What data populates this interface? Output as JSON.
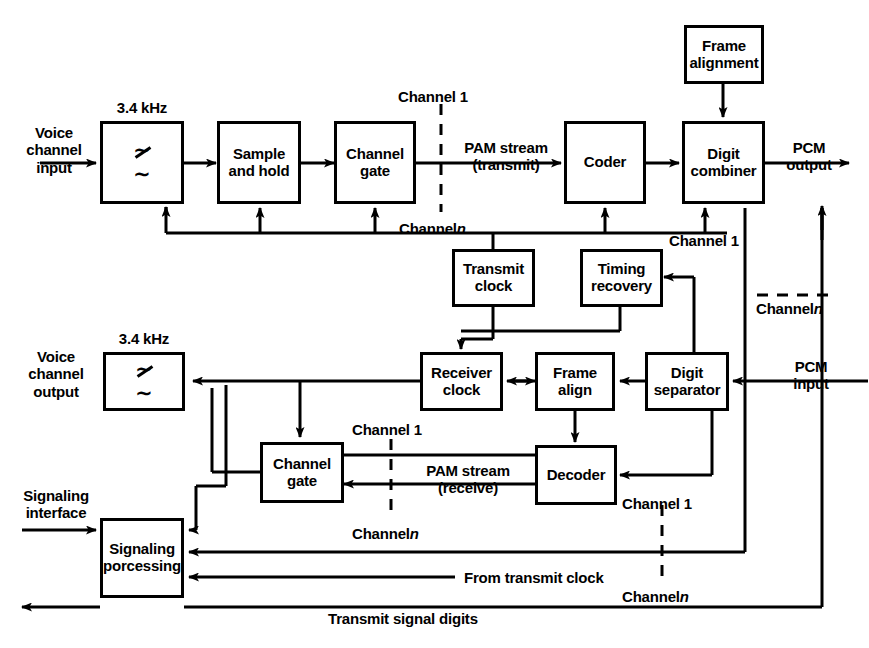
{
  "diagram": {
    "blocks": [
      {
        "id": "frame_alignment",
        "label": "Frame\nalignment"
      },
      {
        "id": "filter_tx",
        "label": "filter-symbol"
      },
      {
        "id": "sample_hold",
        "label": "Sample\nand\nhold"
      },
      {
        "id": "channel_gate_tx",
        "label": "Channel\ngate"
      },
      {
        "id": "coder",
        "label": "Coder"
      },
      {
        "id": "digit_combiner",
        "label": "Digit\ncombiner"
      },
      {
        "id": "transmit_clock",
        "label": "Transmit\nclock"
      },
      {
        "id": "timing_recovery",
        "label": "Timing\nrecovery"
      },
      {
        "id": "filter_rx",
        "label": "filter-symbol"
      },
      {
        "id": "receiver_clock",
        "label": "Receiver\nclock"
      },
      {
        "id": "frame_align",
        "label": "Frame\nalign"
      },
      {
        "id": "digit_separator",
        "label": "Digit\nseparator"
      },
      {
        "id": "channel_gate_rx",
        "label": "Channel\ngate"
      },
      {
        "id": "decoder",
        "label": "Decoder"
      },
      {
        "id": "signaling_processing",
        "label": "Signaling\nporcessing"
      }
    ],
    "labels": {
      "voice_channel_input": "Voice\nchannel\ninput",
      "filter_tx_caption": "3.4 kHz",
      "channel_1_tx_gate": "Channel  1",
      "channel_n_tx_gate": "Channel",
      "channel_n_tx_gate_italic": "n",
      "pam_stream_transmit": "PAM stream\n(transmit)",
      "pcm_output": "PCM\noutput",
      "channel_1_combiner": "Channel 1",
      "channel_n_combiner": "Channel",
      "channel_n_combiner_italic": "n",
      "voice_channel_output": "Voice\nchannel\noutput",
      "filter_rx_caption": "3.4 kHz",
      "pcm_input": "PCM\ninput",
      "channel_1_rx_gate": "Channel 1",
      "channel_n_rx_gate": "Channel",
      "channel_n_rx_gate_italic": "n",
      "pam_stream_receive": "PAM stream\n(receive)",
      "channel_1_decoder": "Channel 1",
      "channel_n_decoder": "Channel",
      "channel_n_decoder_italic": "n",
      "signaling_interface": "Signaling\ninterface",
      "from_transmit_clock": "From transmit clock",
      "transmit_signal_digits": "Transmit signal digits"
    },
    "colors": {
      "ink": "#000000",
      "paper": "#ffffff"
    }
  }
}
